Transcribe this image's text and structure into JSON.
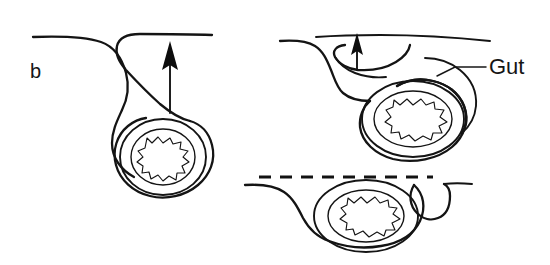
{
  "figure": {
    "kind": "line-drawing",
    "panel_label": "b",
    "background_color": "#ffffff",
    "ink_color": "#141414",
    "width": 550,
    "height": 265
  },
  "labels": {
    "panel": "b",
    "gut": "Gut"
  },
  "panels": [
    {
      "id": "left",
      "name": "panel-left-open-gut-tube",
      "annotations": [
        "b"
      ],
      "arrow": {
        "direction": "up",
        "style": "solid-head",
        "length": 57
      },
      "surface_line": "solid",
      "rings": 2,
      "lumen": "jagged"
    },
    {
      "id": "right",
      "name": "panel-right-enclosed-gut",
      "annotations": [
        "Gut"
      ],
      "arrow": {
        "direction": "up",
        "style": "solid-head",
        "length": 30
      },
      "surface_line": "solid",
      "rings": 2,
      "lumen": "jagged"
    },
    {
      "id": "bottom",
      "name": "panel-bottom-fused-gut",
      "annotations": [],
      "arrow": null,
      "surface_line": "dashed",
      "rings": 2,
      "lumen": "jagged"
    }
  ]
}
